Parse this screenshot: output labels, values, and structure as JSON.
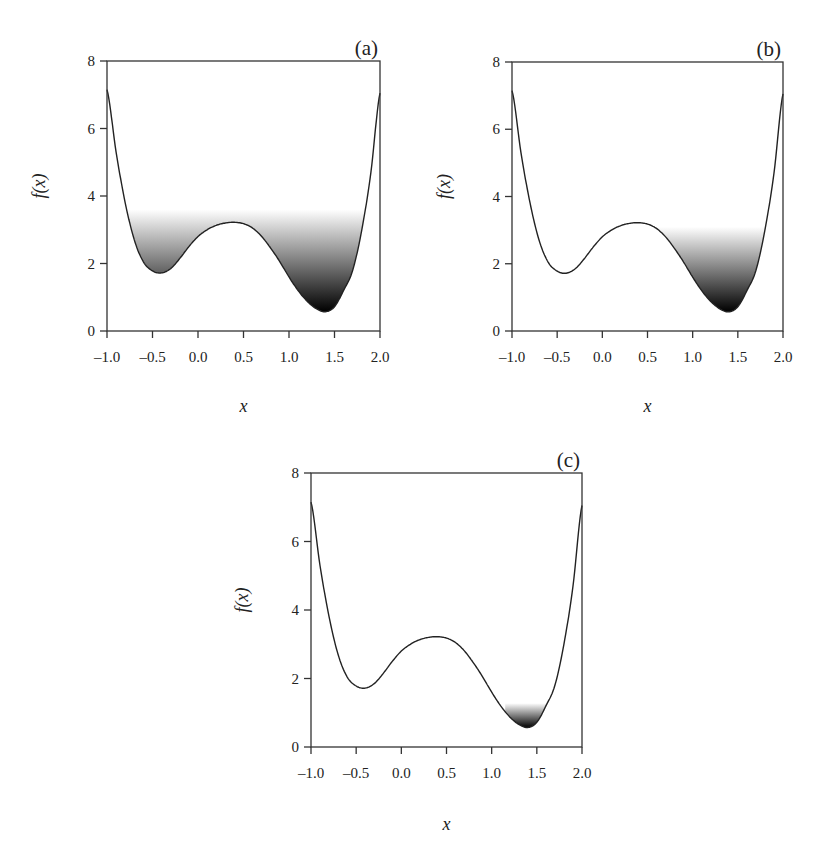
{
  "chart_data": [
    {
      "type": "line",
      "panel": "(a)",
      "title": "(a)",
      "xlabel": "x",
      "ylabel": "f(x)",
      "xlim": [
        -1.0,
        2.0
      ],
      "ylim": [
        0,
        8
      ],
      "xticks": [
        "-1.0",
        "-0.5",
        "0.0",
        "0.5",
        "1.0",
        "1.5",
        "2.0"
      ],
      "yticks": [
        "0",
        "2",
        "4",
        "6",
        "8"
      ],
      "grid": false,
      "shaded_level": 3.6,
      "shaded_x_range": [
        -0.82,
        1.86
      ],
      "x": [
        -1.0,
        -0.9,
        -0.8,
        -0.7,
        -0.6,
        -0.5,
        -0.4,
        -0.3,
        -0.2,
        -0.1,
        0.0,
        0.1,
        0.2,
        0.3,
        0.4,
        0.5,
        0.6,
        0.7,
        0.8,
        0.9,
        1.0,
        1.1,
        1.2,
        1.3,
        1.4,
        1.5,
        1.6,
        1.7,
        1.8,
        1.9,
        2.0
      ],
      "y": [
        7.15,
        5.3,
        3.8,
        2.7,
        2.05,
        1.78,
        1.72,
        1.85,
        2.15,
        2.5,
        2.8,
        3.0,
        3.13,
        3.2,
        3.22,
        3.18,
        3.05,
        2.8,
        2.45,
        2.05,
        1.6,
        1.2,
        0.88,
        0.66,
        0.57,
        0.72,
        1.2,
        1.8,
        3.0,
        4.7,
        7.05
      ]
    },
    {
      "type": "line",
      "panel": "(b)",
      "title": "(b)",
      "xlabel": "x",
      "ylabel": "f(x)",
      "xlim": [
        -1.0,
        2.0
      ],
      "ylim": [
        0,
        8
      ],
      "xticks": [
        "-1.0",
        "-0.5",
        "0.0",
        "0.5",
        "1.0",
        "1.5",
        "2.0"
      ],
      "yticks": [
        "0",
        "2",
        "4",
        "6",
        "8"
      ],
      "grid": false,
      "shaded_level": 3.1,
      "shaded_x_range": [
        0.6,
        1.83
      ],
      "x": [
        -1.0,
        -0.9,
        -0.8,
        -0.7,
        -0.6,
        -0.5,
        -0.4,
        -0.3,
        -0.2,
        -0.1,
        0.0,
        0.1,
        0.2,
        0.3,
        0.4,
        0.5,
        0.6,
        0.7,
        0.8,
        0.9,
        1.0,
        1.1,
        1.2,
        1.3,
        1.4,
        1.5,
        1.6,
        1.7,
        1.8,
        1.9,
        2.0
      ],
      "y": [
        7.15,
        5.3,
        3.8,
        2.7,
        2.05,
        1.78,
        1.72,
        1.85,
        2.15,
        2.5,
        2.8,
        3.0,
        3.13,
        3.2,
        3.22,
        3.18,
        3.05,
        2.8,
        2.45,
        2.05,
        1.6,
        1.2,
        0.88,
        0.66,
        0.57,
        0.72,
        1.2,
        1.8,
        3.0,
        4.7,
        7.05
      ]
    },
    {
      "type": "line",
      "panel": "(c)",
      "title": "(c)",
      "xlabel": "x",
      "ylabel": "f(x)",
      "xlim": [
        -1.0,
        2.0
      ],
      "ylim": [
        0,
        8
      ],
      "xticks": [
        "-1.0",
        "-0.5",
        "0.0",
        "0.5",
        "1.0",
        "1.5",
        "2.0"
      ],
      "yticks": [
        "0",
        "2",
        "4",
        "6",
        "8"
      ],
      "grid": false,
      "shaded_level": 1.28,
      "shaded_x_range": [
        1.15,
        1.62
      ],
      "x": [
        -1.0,
        -0.9,
        -0.8,
        -0.7,
        -0.6,
        -0.5,
        -0.4,
        -0.3,
        -0.2,
        -0.1,
        0.0,
        0.1,
        0.2,
        0.3,
        0.4,
        0.5,
        0.6,
        0.7,
        0.8,
        0.9,
        1.0,
        1.1,
        1.2,
        1.3,
        1.4,
        1.5,
        1.6,
        1.7,
        1.8,
        1.9,
        2.0
      ],
      "y": [
        7.15,
        5.3,
        3.8,
        2.7,
        2.05,
        1.78,
        1.72,
        1.85,
        2.15,
        2.5,
        2.8,
        3.0,
        3.13,
        3.2,
        3.22,
        3.18,
        3.05,
        2.8,
        2.45,
        2.05,
        1.6,
        1.2,
        0.88,
        0.66,
        0.57,
        0.72,
        1.2,
        1.8,
        3.0,
        4.7,
        7.05
      ]
    }
  ],
  "panels": {
    "a": {
      "label": "(a)",
      "xlabel": "x",
      "ylabel": "f(x)"
    },
    "b": {
      "label": "(b)",
      "xlabel": "x",
      "ylabel": "f(x)"
    },
    "c": {
      "label": "(c)",
      "xlabel": "x",
      "ylabel": "f(x)"
    }
  },
  "colors": {
    "curve": "#222222",
    "shade_dark": "#000000",
    "shade_light": "#ffffff"
  }
}
